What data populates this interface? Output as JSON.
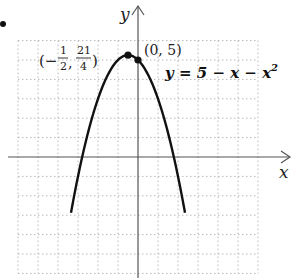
{
  "chart_data": {
    "type": "line",
    "title": "",
    "equation": "y = 5 − x − x²",
    "xlabel": "x",
    "ylabel": "y",
    "xlim": [
      -6,
      6
    ],
    "ylim": [
      -6,
      6
    ],
    "grid": true,
    "grid_step": 1,
    "series": [
      {
        "name": "y = 5 − x − x²",
        "function": "5 - x - x^2",
        "x": [
          -3.3,
          -3,
          -2.5,
          -2,
          -1.5,
          -1,
          -0.5,
          0,
          0.5,
          1,
          1.5,
          2,
          2.3
        ],
        "y": [
          -1.59,
          -1,
          1.25,
          3,
          4.25,
          5,
          5.25,
          5,
          4.25,
          3,
          1.25,
          -1,
          -2.59
        ]
      }
    ],
    "points": [
      {
        "label_num": "−1/2",
        "label_den": "21/4",
        "x": -0.5,
        "y": 5.25,
        "label": "(−1/2, 21/4)"
      },
      {
        "label": "(0, 5)",
        "x": 0,
        "y": 5
      }
    ],
    "annotations": [
      "(−1/2, 21/4)",
      "(0, 5)",
      "y = 5 − x − x²"
    ]
  },
  "labels": {
    "axis_x": "x",
    "axis_y": "y",
    "point_vertex_open": "(−",
    "point_vertex_frac1_num": "1",
    "point_vertex_frac1_den": "2",
    "point_vertex_comma": ",",
    "point_vertex_frac2_num": "21",
    "point_vertex_frac2_den": "4",
    "point_vertex_close": ")",
    "point_intercept": "(0, 5)",
    "equation_lhs": "y = 5 − x − x",
    "equation_exp": "2"
  }
}
